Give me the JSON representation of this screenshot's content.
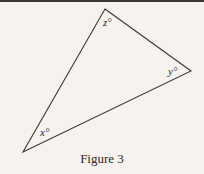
{
  "figure": {
    "caption": "Figure 3",
    "stroke_color": "#3a3836",
    "background": "#f6f3ee",
    "vertices": {
      "top": {
        "x": 105,
        "y": 9
      },
      "right": {
        "x": 191,
        "y": 71
      },
      "bottom_left": {
        "x": 23,
        "y": 152
      }
    },
    "labels": {
      "top": "z°",
      "right": "y°",
      "bottom_left": "x°"
    }
  }
}
